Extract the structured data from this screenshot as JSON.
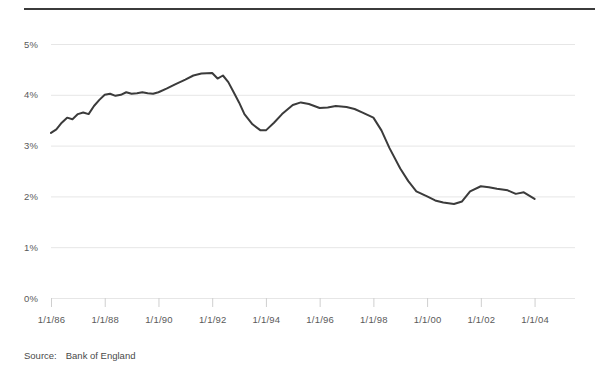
{
  "figure": {
    "source_label": "Source:",
    "source_value": "Bank of England"
  },
  "chart_data": {
    "type": "line",
    "title": "",
    "subtitle": "",
    "xlabel": "",
    "ylabel": "",
    "grid": true,
    "legend": "none",
    "xlim": [
      "1/1/1986",
      "1/1/2004"
    ],
    "ylim": [
      0,
      5
    ],
    "y_unit": "%",
    "y_ticks": [
      0,
      1,
      2,
      3,
      4,
      5
    ],
    "y_tick_labels": [
      "0%",
      "1%",
      "2%",
      "3%",
      "4%",
      "5%"
    ],
    "x_tick_labels": [
      "1/1/86",
      "1/1/88",
      "1/1/90",
      "1/1/92",
      "1/1/94",
      "1/1/96",
      "1/1/98",
      "1/1/00",
      "1/1/02",
      "1/1/04"
    ],
    "x_tick_values": [
      1986.0,
      1988.0,
      1990.0,
      1992.0,
      1994.0,
      1996.0,
      1998.0,
      2000.0,
      2002.0,
      2004.0
    ],
    "line_color": "#3b3b3b",
    "series": [
      {
        "name": "Bank of England rate",
        "x": [
          1986.0,
          1986.2,
          1986.4,
          1986.6,
          1986.8,
          1987.0,
          1987.2,
          1987.4,
          1987.6,
          1987.8,
          1988.0,
          1988.2,
          1988.4,
          1988.6,
          1988.8,
          1989.0,
          1989.2,
          1989.4,
          1989.6,
          1989.8,
          1990.0,
          1990.3,
          1990.6,
          1991.0,
          1991.3,
          1991.6,
          1992.0,
          1992.2,
          1992.4,
          1992.6,
          1992.8,
          1993.0,
          1993.2,
          1993.5,
          1993.8,
          1994.0,
          1994.3,
          1994.6,
          1995.0,
          1995.3,
          1995.6,
          1996.0,
          1996.3,
          1996.6,
          1997.0,
          1997.3,
          1997.6,
          1998.0,
          1998.3,
          1998.6,
          1999.0,
          1999.3,
          1999.6,
          2000.0,
          2000.3,
          2000.6,
          2001.0,
          2001.3,
          2001.6,
          2002.0,
          2002.3,
          2002.6,
          2003.0,
          2003.3,
          2003.6,
          2004.0
        ],
        "y": [
          3.25,
          3.32,
          3.45,
          3.55,
          3.52,
          3.62,
          3.65,
          3.62,
          3.78,
          3.9,
          4.0,
          4.02,
          3.98,
          4.0,
          4.05,
          4.02,
          4.03,
          4.05,
          4.03,
          4.02,
          4.05,
          4.12,
          4.2,
          4.3,
          4.38,
          4.42,
          4.43,
          4.32,
          4.38,
          4.25,
          4.05,
          3.85,
          3.62,
          3.42,
          3.3,
          3.3,
          3.45,
          3.62,
          3.8,
          3.85,
          3.82,
          3.74,
          3.75,
          3.78,
          3.76,
          3.72,
          3.65,
          3.55,
          3.3,
          2.95,
          2.55,
          2.3,
          2.1,
          2.0,
          1.92,
          1.88,
          1.85,
          1.9,
          2.1,
          2.2,
          2.18,
          2.15,
          2.12,
          2.05,
          2.08,
          1.95
        ]
      }
    ]
  }
}
